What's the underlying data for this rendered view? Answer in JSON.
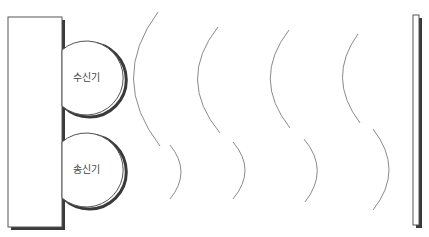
{
  "diagram": {
    "type": "radar-reflection-schematic",
    "device": {
      "name": "device-body",
      "x": 8,
      "y": 17,
      "width": 54,
      "height": 210
    },
    "receiver": {
      "label": "수신기",
      "cx": 84,
      "cy": 78,
      "r": 37
    },
    "transmitter": {
      "label": "송신기",
      "cx": 83,
      "cy": 170,
      "r": 37
    },
    "reflector_wall": {
      "x": 413,
      "y": 15,
      "width": 6,
      "height": 210
    },
    "incoming_waves": [
      {
        "x_top": 158,
        "y_top": 12,
        "x_mid": 133,
        "y_mid": 78,
        "x_bot": 160,
        "y_bot": 146
      },
      {
        "x_top": 218,
        "y_top": 27,
        "x_mid": 197,
        "y_mid": 78,
        "x_bot": 220,
        "y_bot": 133
      },
      {
        "x_top": 289,
        "y_top": 30,
        "x_mid": 270,
        "y_mid": 78,
        "x_bot": 290,
        "y_bot": 128
      },
      {
        "x_top": 358,
        "y_top": 34,
        "x_mid": 342,
        "y_mid": 80,
        "x_bot": 360,
        "y_bot": 123
      }
    ],
    "outgoing_waves": [
      {
        "x_top": 170,
        "y_top": 145,
        "x_mid": 181,
        "y_mid": 172,
        "x_bot": 170,
        "y_bot": 199
      },
      {
        "x_top": 233,
        "y_top": 142,
        "x_mid": 245,
        "y_mid": 170,
        "x_bot": 233,
        "y_bot": 199
      },
      {
        "x_top": 304,
        "y_top": 139,
        "x_mid": 317,
        "y_mid": 170,
        "x_bot": 305,
        "y_bot": 202
      },
      {
        "x_top": 373,
        "y_top": 129,
        "x_mid": 389,
        "y_mid": 170,
        "x_bot": 373,
        "y_bot": 210
      }
    ],
    "colors": {
      "stroke": "#555555",
      "wave": "#8a8a8a",
      "shadow": "#3a3a3a",
      "fill": "#ffffff",
      "text": "#444444"
    }
  }
}
